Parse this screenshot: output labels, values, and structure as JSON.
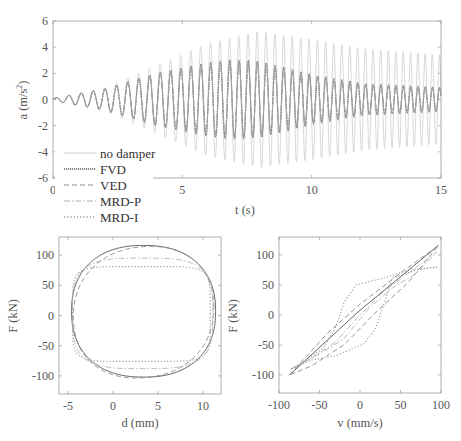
{
  "chart_data": [
    {
      "id": "time-history",
      "type": "line",
      "title": "",
      "xlabel": "t (s)",
      "ylabel": "a (m/s^2)",
      "ylabel_base": "a (m/s",
      "ylabel_sup": "2",
      "ylabel_end": ")",
      "xlim": [
        0,
        15
      ],
      "ylim": [
        -6,
        6
      ],
      "xticks": [
        0,
        5,
        10,
        15
      ],
      "yticks": [
        -6,
        -4,
        -2,
        0,
        2,
        4,
        6
      ],
      "grid": false,
      "legend_position": "lower-left (outside overlap)",
      "legend": [
        "no damper",
        "FVD",
        "VED",
        "MRD-P",
        "MRD-I"
      ],
      "frequency_hz": 2.0,
      "series": [
        {
          "name": "no damper",
          "style": "solid",
          "color": "#d4d4d4",
          "peak_envelope": {
            "t": [
              0,
              2,
              4,
              6,
              8,
              10,
              12,
              15
            ],
            "amp": [
              0.1,
              0.9,
              2.6,
              4.3,
              5.2,
              4.6,
              3.9,
              3.4
            ]
          }
        },
        {
          "name": "FVD",
          "style": "dotted-dense",
          "color": "#6a6a6a",
          "peak_envelope": {
            "t": [
              0,
              2,
              4,
              6,
              7,
              8,
              10,
              12,
              15
            ],
            "amp": [
              0.1,
              0.8,
              2.0,
              2.8,
              3.0,
              2.9,
              1.9,
              1.2,
              0.9
            ]
          }
        },
        {
          "name": "VED",
          "style": "dashed",
          "color": "#8a8a8a",
          "peak_envelope": {
            "t": [
              0,
              2,
              4,
              6,
              7,
              8,
              10,
              12,
              15
            ],
            "amp": [
              0.1,
              0.8,
              2.0,
              2.8,
              3.0,
              2.9,
              1.9,
              1.2,
              0.9
            ]
          }
        },
        {
          "name": "MRD-P",
          "style": "dash-dot",
          "color": "#b0b0b0",
          "peak_envelope": {
            "t": [
              0,
              2,
              4,
              6,
              7,
              8,
              10,
              12,
              15
            ],
            "amp": [
              0.1,
              0.8,
              2.0,
              2.7,
              2.9,
              2.8,
              1.8,
              1.2,
              0.9
            ]
          }
        },
        {
          "name": "MRD-I",
          "style": "dotted",
          "color": "#9a9a9a",
          "peak_envelope": {
            "t": [
              0,
              2,
              4,
              6,
              7,
              8,
              10,
              12,
              15
            ],
            "amp": [
              0.1,
              0.8,
              2.0,
              2.7,
              2.9,
              2.8,
              1.8,
              1.2,
              0.9
            ]
          }
        }
      ]
    },
    {
      "id": "force-displacement",
      "type": "line",
      "xlabel": "d (mm)",
      "ylabel": "F (kN)",
      "xlim": [
        -6,
        12
      ],
      "ylim": [
        -130,
        130
      ],
      "xticks": [
        -5,
        0,
        5,
        10
      ],
      "yticks": [
        -100,
        -50,
        0,
        50,
        100
      ],
      "grid": false,
      "series": [
        {
          "name": "FVD",
          "style": "solid",
          "color": "#555555",
          "x_range": [
            -4.6,
            11.4
          ],
          "y_range": [
            -102,
            116
          ],
          "squareness": 2.3
        },
        {
          "name": "VED",
          "style": "dashed",
          "color": "#8a8a8a",
          "x_range": [
            -4.4,
            11.2
          ],
          "y_range": [
            -103,
            114
          ],
          "squareness": 2.2,
          "tilt": 8
        },
        {
          "name": "MRD-P",
          "style": "dash-dot",
          "color": "#b5b5b5",
          "x_range": [
            -4.5,
            11.1
          ],
          "y_range": [
            -88,
            95
          ],
          "squareness": 3.5
        },
        {
          "name": "MRD-I",
          "style": "dotted",
          "color": "#9a9a9a",
          "x_range": [
            -4.5,
            10.8
          ],
          "y_range": [
            -76,
            81
          ],
          "squareness": 6.0
        }
      ]
    },
    {
      "id": "force-velocity",
      "type": "line",
      "xlabel": "v (mm/s)",
      "ylabel": "F (kN)",
      "xlim": [
        -100,
        100
      ],
      "ylim": [
        -130,
        130
      ],
      "xticks": [
        -100,
        -50,
        0,
        50,
        100
      ],
      "yticks": [
        -100,
        -50,
        0,
        50,
        100
      ],
      "grid": false,
      "series": [
        {
          "name": "FVD",
          "style": "solid",
          "color": "#555555",
          "points": [
            [
              -87,
              -100
            ],
            [
              0,
              8
            ],
            [
              97,
              116
            ]
          ]
        },
        {
          "name": "VED",
          "style": "dashed",
          "color": "#8a8a8a",
          "loop": [
            [
              -87,
              -100
            ],
            [
              -40,
              -30
            ],
            [
              0,
              18
            ],
            [
              50,
              70
            ],
            [
              97,
              116
            ],
            [
              60,
              55
            ],
            [
              20,
              5
            ],
            [
              -20,
              -50
            ],
            [
              -60,
              -85
            ],
            [
              -87,
              -100
            ]
          ]
        },
        {
          "name": "MRD-P",
          "style": "dash-dot",
          "color": "#b5b5b5",
          "loop": [
            [
              -85,
              -90
            ],
            [
              -60,
              -72
            ],
            [
              -30,
              -45
            ],
            [
              0,
              0
            ],
            [
              30,
              40
            ],
            [
              60,
              70
            ],
            [
              95,
              105
            ],
            [
              70,
              70
            ],
            [
              40,
              45
            ],
            [
              10,
              10
            ],
            [
              -20,
              -40
            ],
            [
              -50,
              -65
            ],
            [
              -85,
              -90
            ]
          ]
        },
        {
          "name": "MRD-I",
          "style": "dotted",
          "color": "#9a9a9a",
          "loop": [
            [
              -85,
              -90
            ],
            [
              -60,
              -75
            ],
            [
              -30,
              -68
            ],
            [
              5,
              -48
            ],
            [
              20,
              -20
            ],
            [
              30,
              20
            ],
            [
              40,
              62
            ],
            [
              70,
              75
            ],
            [
              95,
              80
            ],
            [
              60,
              75
            ],
            [
              30,
              62
            ],
            [
              -5,
              50
            ],
            [
              -20,
              20
            ],
            [
              -30,
              -20
            ],
            [
              -45,
              -55
            ],
            [
              -70,
              -78
            ],
            [
              -85,
              -90
            ]
          ]
        }
      ]
    }
  ]
}
